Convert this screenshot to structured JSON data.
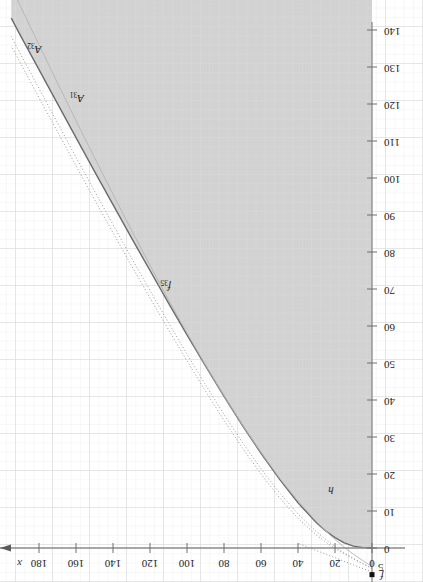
{
  "figure": {
    "orientation": "rotated-180",
    "background_color": "#ffffff",
    "shaded_region_color": "#d2d2d2",
    "grid_color": "#e3e3e3",
    "grid_major_color": "#cfcfcf",
    "axis_color": "#8a8a8a",
    "text_color": "#1b1b1b"
  },
  "axes": {
    "x": {
      "name": "x",
      "ticks": [
        "0",
        "20",
        "40",
        "60",
        "80",
        "100",
        "120",
        "140",
        "160",
        "180"
      ],
      "tick_values": [
        0,
        20,
        40,
        60,
        80,
        100,
        120,
        140,
        160,
        180
      ],
      "min": 0,
      "max": 195,
      "has_arrow": true
    },
    "y": {
      "name": "",
      "ticks": [
        "0",
        "10",
        "20",
        "30",
        "40",
        "50",
        "60",
        "70",
        "80",
        "90",
        "100",
        "110",
        "120",
        "130",
        "140"
      ],
      "tick_values": [
        0,
        10,
        20,
        30,
        40,
        50,
        60,
        70,
        80,
        90,
        100,
        110,
        120,
        130,
        140
      ],
      "min": -6,
      "max": 145,
      "below_axis_label": "5"
    }
  },
  "curve_labels": [
    {
      "id": "A32",
      "base": "A",
      "sub": "32"
    },
    {
      "id": "A31",
      "base": "A",
      "sub": "31"
    },
    {
      "id": "f35",
      "base": "f",
      "sub": "35"
    },
    {
      "id": "h",
      "base": "h",
      "sub": ""
    },
    {
      "id": "f",
      "base": "f",
      "sub": ""
    }
  ],
  "chart_data": {
    "type": "line",
    "title": "",
    "xlabel": "x",
    "ylabel": "",
    "xlim": [
      0,
      195
    ],
    "ylim": [
      -6,
      145
    ],
    "grid": true,
    "legend": "inline-curve-labels",
    "shaded_region": {
      "label": "feasible-region",
      "color": "#d2d2d2",
      "description": "region above the boundary curve h, filled light gray"
    },
    "series": [
      {
        "name": "h",
        "style": "solid",
        "color": "#6b6b6b",
        "width": 1.4,
        "label_at": {
          "x": 25,
          "y": 16
        },
        "x": [
          0,
          5,
          10,
          15,
          20,
          25,
          30,
          40,
          50,
          60,
          70,
          80,
          90,
          100,
          110,
          120,
          130,
          140,
          150,
          160,
          170,
          180,
          190,
          195
        ],
        "y": [
          0.0,
          0.1,
          0.5,
          1.4,
          2.8,
          4.6,
          6.8,
          12.2,
          18.6,
          25.6,
          33.1,
          41.0,
          49.2,
          57.6,
          66.2,
          75.0,
          83.8,
          92.8,
          101.8,
          110.9,
          120.1,
          129.3,
          138.5,
          143.2
        ]
      },
      {
        "name": "A31",
        "style": "dotted",
        "color": "#9a9a9a",
        "width": 1.0,
        "label_at": {
          "x": 160,
          "y": 122
        },
        "x": [
          0,
          5,
          10,
          15,
          20,
          25,
          30,
          40,
          50,
          60,
          70,
          80,
          90,
          100,
          110,
          120,
          130,
          140,
          150,
          160,
          170,
          180,
          190,
          195
        ],
        "y": [
          -5.5,
          -4.3,
          -3.0,
          -1.6,
          -0.1,
          1.6,
          3.5,
          8.0,
          13.6,
          20.0,
          27.0,
          34.5,
          42.4,
          50.6,
          59.0,
          67.6,
          76.3,
          85.2,
          94.2,
          103.3,
          112.5,
          121.7,
          131.0,
          135.7
        ]
      },
      {
        "name": "A32",
        "style": "dotted",
        "color": "#9a9a9a",
        "width": 1.0,
        "label_at": {
          "x": 183,
          "y": 135
        },
        "x": [
          0,
          5,
          10,
          15,
          20,
          25,
          30,
          40,
          50,
          60,
          70,
          80,
          90,
          100,
          110,
          120,
          130,
          140,
          150,
          160,
          170,
          180,
          190,
          195
        ],
        "y": [
          -5.5,
          -4.2,
          -2.8,
          -1.3,
          0.4,
          2.3,
          4.4,
          9.2,
          14.9,
          21.4,
          28.5,
          36.1,
          44.1,
          52.4,
          60.9,
          69.6,
          78.4,
          87.4,
          96.5,
          105.6,
          114.9,
          124.2,
          133.5,
          138.2
        ]
      },
      {
        "name": "f35",
        "style": "solid",
        "color": "#b4b4b4",
        "width": 0.9,
        "label_at": {
          "x": 113,
          "y": 71
        },
        "x": [
          0,
          5,
          10,
          15,
          20,
          25,
          30,
          40,
          50,
          60,
          70,
          80,
          90,
          100,
          110,
          120,
          130,
          140,
          150,
          160,
          170,
          180,
          190,
          195
        ],
        "y": [
          -5.0,
          -3.4,
          -1.7,
          0.2,
          2.3,
          4.6,
          7.1,
          12.7,
          18.9,
          25.8,
          33.2,
          41.1,
          49.4,
          58.1,
          67.1,
          76.4,
          85.9,
          95.6,
          105.5,
          115.5,
          125.7,
          136.0,
          146.4,
          151.6
        ]
      },
      {
        "name": "f",
        "style": "dotted",
        "color": "#9a9a9a",
        "width": 1.0,
        "label_at": {
          "x": -2,
          "y": -7
        },
        "x": [
          0,
          10,
          20,
          30,
          40
        ],
        "y": [
          -6.5,
          -4.6,
          -2.6,
          -0.7,
          1.3
        ]
      }
    ],
    "markers": [
      {
        "name": "origin-square-marker",
        "x": 0,
        "y": -7.2,
        "shape": "square",
        "color": "#111111",
        "size": 5
      }
    ]
  }
}
